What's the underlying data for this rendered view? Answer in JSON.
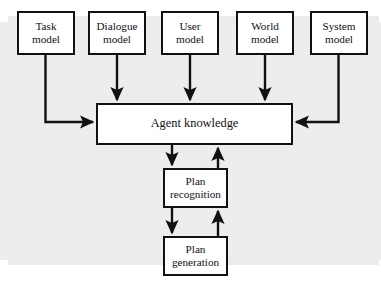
{
  "diagram": {
    "type": "block-flow-diagram",
    "colors": {
      "background": "#ffffff",
      "plate": "#ededed",
      "box_fill": "#ffffff",
      "stroke": "#111111"
    },
    "nodes": [
      {
        "id": "task-model",
        "label": "Task\nmodel",
        "x": 17,
        "y": 11,
        "w": 58,
        "h": 44
      },
      {
        "id": "dialogue-model",
        "label": "Dialogue\nmodel",
        "x": 88,
        "y": 11,
        "w": 58,
        "h": 44
      },
      {
        "id": "user-model",
        "label": "User\nmodel",
        "x": 161,
        "y": 11,
        "w": 58,
        "h": 44
      },
      {
        "id": "world-model",
        "label": "World\nmodel",
        "x": 236,
        "y": 11,
        "w": 58,
        "h": 44
      },
      {
        "id": "system-model",
        "label": "System\nmodel",
        "x": 310,
        "y": 11,
        "w": 58,
        "h": 44
      },
      {
        "id": "agent-knowledge",
        "label": "Agent knowledge",
        "x": 96,
        "y": 103,
        "w": 197,
        "h": 42
      },
      {
        "id": "plan-recognition",
        "label": "Plan\nrecognition",
        "x": 163,
        "y": 168,
        "w": 65,
        "h": 40
      },
      {
        "id": "plan-generation",
        "label": "Plan\ngeneration",
        "x": 163,
        "y": 236,
        "w": 65,
        "h": 40
      }
    ],
    "edges": [
      {
        "id": "task-to-agent",
        "from": "task-model",
        "to": "agent-knowledge",
        "route": "down-then-right"
      },
      {
        "id": "dialogue-to-agent",
        "from": "dialogue-model",
        "to": "agent-knowledge",
        "route": "straight-down"
      },
      {
        "id": "user-to-agent",
        "from": "user-model",
        "to": "agent-knowledge",
        "route": "straight-down"
      },
      {
        "id": "world-to-agent",
        "from": "world-model",
        "to": "agent-knowledge",
        "route": "straight-down"
      },
      {
        "id": "system-to-agent",
        "from": "system-model",
        "to": "agent-knowledge",
        "route": "down-then-left"
      },
      {
        "id": "agent-to-plan-recognition",
        "from": "agent-knowledge",
        "to": "plan-recognition",
        "route": "straight-down"
      },
      {
        "id": "plan-recognition-to-agent",
        "from": "plan-recognition",
        "to": "agent-knowledge",
        "route": "straight-up"
      },
      {
        "id": "plan-recognition-to-plan-generation",
        "from": "plan-recognition",
        "to": "plan-generation",
        "route": "straight-down"
      },
      {
        "id": "plan-generation-to-plan-recognition",
        "from": "plan-generation",
        "to": "plan-recognition",
        "route": "straight-up"
      }
    ]
  }
}
